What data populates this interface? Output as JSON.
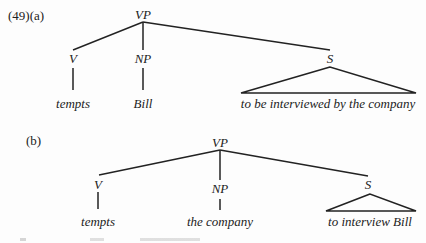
{
  "example_a": {
    "label": "(49)(a)",
    "root": "VP",
    "children": [
      {
        "cat": "V",
        "word": "tempts"
      },
      {
        "cat": "NP",
        "word": "Bill"
      },
      {
        "cat": "S",
        "word": "to be interviewed by the company",
        "triangle": true
      }
    ]
  },
  "example_b": {
    "label": "(b)",
    "root": "VP",
    "children": [
      {
        "cat": "V",
        "word": "tempts"
      },
      {
        "cat": "NP",
        "word": "the company"
      },
      {
        "cat": "S",
        "word": "to interview Bill",
        "triangle": true
      }
    ]
  }
}
